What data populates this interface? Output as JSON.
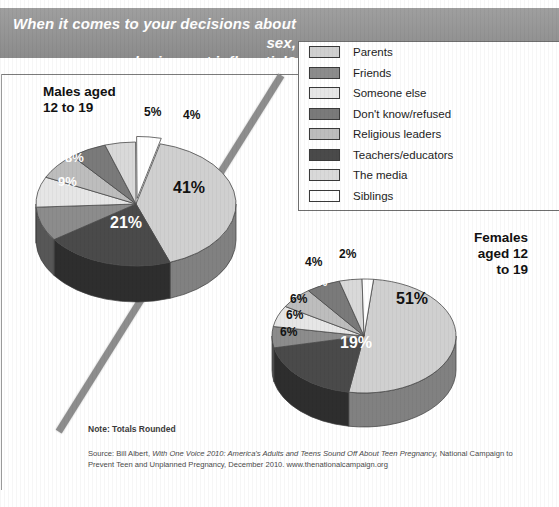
{
  "banner": {
    "title": "When it comes to your decisions about sex,\nwho is most influential?",
    "bg_color": "#949494",
    "text_color": "#ffffff"
  },
  "legend": {
    "items": [
      {
        "label": "Parents",
        "color": "#d0d0d0"
      },
      {
        "label": "Friends",
        "color": "#8c8c8c"
      },
      {
        "label": "Someone else",
        "color": "#e6e6e6"
      },
      {
        "label": "Don't know/refused",
        "color": "#7a7a7a"
      },
      {
        "label": "Religious leaders",
        "color": "#bdbdbd"
      },
      {
        "label": "Teachers/educators",
        "color": "#4a4a4a"
      },
      {
        "label": "The media",
        "color": "#d9d9d9"
      },
      {
        "label": "Siblings",
        "color": "#ffffff"
      }
    ]
  },
  "charts": [
    {
      "id": "males",
      "title": "Males aged\n12 to 19",
      "labels": [
        "41%",
        "21%",
        "9%",
        "8%",
        "7%",
        "6%",
        "5%",
        "4%"
      ]
    },
    {
      "id": "females",
      "title": "Females\naged 12\nto 19",
      "labels": [
        "51%",
        "19%",
        "6%",
        "6%",
        "6%",
        "6%",
        "4%",
        "2%"
      ]
    }
  ],
  "footer": {
    "note": "Note: Totals Rounded",
    "source_pre": "Source: Bill Albert, ",
    "source_italic": "With One Voice 2010: America's Adults and Teens Sound Off About Teen Pregnancy,",
    "source_post": "National Campaign to Prevent Teen and Unplanned Pregnancy, December 2010. www.thenationalcampaign.org"
  },
  "chart_data": [
    {
      "type": "pie",
      "title": "Males aged 12 to 19",
      "categories": [
        "Parents",
        "Teachers/educators",
        "Friends",
        "Someone else",
        "Religious leaders",
        "Don't know/refused",
        "The media",
        "Siblings"
      ],
      "values": [
        41,
        21,
        9,
        8,
        7,
        6,
        5,
        4
      ],
      "value_labels": [
        "41%",
        "21%",
        "9%",
        "8%",
        "7%",
        "6%",
        "5%",
        "4%"
      ],
      "colors": [
        "#d0d0d0",
        "#4a4a4a",
        "#8c8c8c",
        "#e6e6e6",
        "#bdbdbd",
        "#7a7a7a",
        "#d9d9d9",
        "#ffffff"
      ],
      "legend_position": "top-right",
      "grid": false,
      "unit": "percent"
    },
    {
      "type": "pie",
      "title": "Females aged 12 to 19",
      "categories": [
        "Parents",
        "Teachers/educators",
        "Friends",
        "Someone else",
        "Religious leaders",
        "Don't know/refused",
        "The media",
        "Siblings"
      ],
      "values": [
        51,
        19,
        6,
        6,
        6,
        6,
        4,
        2
      ],
      "value_labels": [
        "51%",
        "19%",
        "6%",
        "6%",
        "6%",
        "6%",
        "4%",
        "2%"
      ],
      "colors": [
        "#d0d0d0",
        "#4a4a4a",
        "#8c8c8c",
        "#e6e6e6",
        "#bdbdbd",
        "#7a7a7a",
        "#d9d9d9",
        "#ffffff"
      ],
      "legend_position": "top-right",
      "grid": false,
      "unit": "percent"
    }
  ]
}
